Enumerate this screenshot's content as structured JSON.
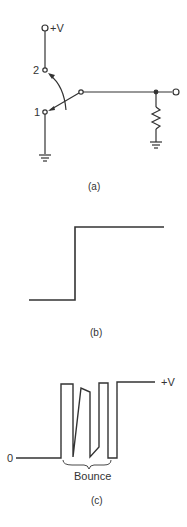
{
  "figure": {
    "panel_a": {
      "caption": "(a)",
      "supply_label": "+V",
      "contact_2_label": "2",
      "contact_1_label": "1",
      "components": [
        "spdt-switch",
        "pull-down-resistor",
        "ground",
        "ground",
        "output-terminal"
      ]
    },
    "panel_b": {
      "caption": "(b)",
      "description": "ideal step from low to high"
    },
    "panel_c": {
      "caption": "(c)",
      "zero_label": "0",
      "high_label": "+V",
      "bounce_label": "Bounce"
    }
  },
  "colors": {
    "line": "#333333",
    "background": "#ffffff"
  }
}
